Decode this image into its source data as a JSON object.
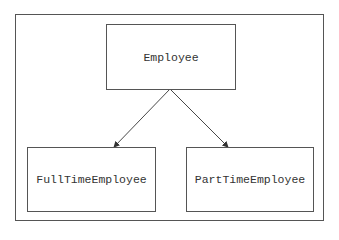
{
  "diagram": {
    "type": "class-hierarchy",
    "nodes": [
      {
        "id": "employee",
        "label": "Employee"
      },
      {
        "id": "fulltime",
        "label": "FullTimeEmployee"
      },
      {
        "id": "parttime",
        "label": "PartTimeEmployee"
      }
    ],
    "edges": [
      {
        "from": "employee",
        "to": "fulltime"
      },
      {
        "from": "employee",
        "to": "parttime"
      }
    ],
    "colors": {
      "stroke": "#555555",
      "text": "#333333",
      "background": "#ffffff"
    }
  }
}
